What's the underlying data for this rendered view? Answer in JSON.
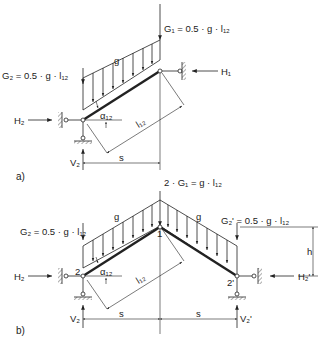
{
  "diagram": {
    "part_a": {
      "tag": "a)",
      "G1": "G₁ = 0.5 · g · l₁₂",
      "G2": "G₂ = 0.5 · g · l₁₂",
      "load": "g",
      "H1": "H₁",
      "H2": "H₂",
      "V2": "V₂",
      "alpha": "α₁₂",
      "length": "l₁₂",
      "span": "s"
    },
    "part_b": {
      "tag": "b)",
      "G_center": "2 · G₁ = g · l₁₂",
      "G2": "G₂ = 0.5 · g · l₁₂",
      "G2p": "G₂' = 0.5 · g · l₁₂",
      "load_left": "g",
      "load_right": "g",
      "H2": "H₂",
      "H2p": "H₂'",
      "V2": "V₂",
      "V2p": "V₂'",
      "alpha": "α₁₂",
      "length": "l₁₂",
      "span_left": "s",
      "span_right": "s",
      "height": "h",
      "node_1": "1",
      "node_2": "2",
      "node_2p": "2'"
    }
  }
}
